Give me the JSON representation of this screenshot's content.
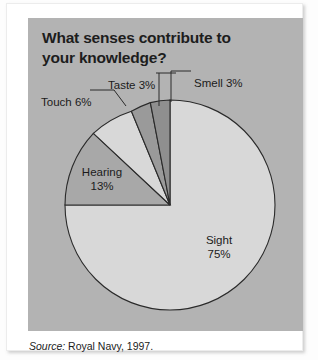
{
  "panel": {
    "title": "What senses contribute to\nyour knowledge?",
    "background_color": "#b3b3b3"
  },
  "source": {
    "prefix": "Source:",
    "text": " Royal Navy, 1997."
  },
  "labels": {
    "taste": "Taste 3%",
    "touch": "Touch 6%",
    "smell": "Smell 3%",
    "hearing_name": "Hearing",
    "hearing_value": "13%",
    "sight_name": "Sight",
    "sight_value": "75%"
  },
  "chart_data": {
    "type": "pie",
    "xlabel": "",
    "ylabel": "",
    "unit": "%",
    "legend": "none",
    "grid": false,
    "start_angle_deg": 0,
    "direction": "clockwise",
    "categories": [
      "Sight",
      "Hearing",
      "Touch",
      "Taste",
      "Smell"
    ],
    "values": [
      75,
      13,
      6,
      3,
      3
    ],
    "slices": [
      {
        "name": "Sight",
        "value": 75,
        "label": "Sight 75%",
        "color": "#d8d8d8",
        "label_placement": "inside"
      },
      {
        "name": "Hearing",
        "value": 13,
        "label": "Hearing 13%",
        "color": "#a8a8a8",
        "label_placement": "inside"
      },
      {
        "name": "Touch",
        "value": 6,
        "label": "Touch 6%",
        "color": "#d8d8d8",
        "label_placement": "callout"
      },
      {
        "name": "Taste",
        "value": 3,
        "label": "Taste 3%",
        "color": "#9a9a9a",
        "label_placement": "callout"
      },
      {
        "name": "Smell",
        "value": 3,
        "label": "Smell 3%",
        "color": "#8f8f8f",
        "label_placement": "callout"
      }
    ],
    "annotations": [
      "Source: Royal Navy, 1997."
    ]
  }
}
